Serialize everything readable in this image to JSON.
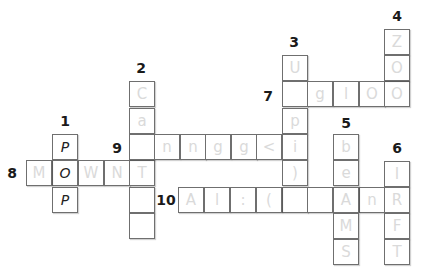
{
  "puzzle": {
    "cell_size": 26,
    "numbers": [
      {
        "label": "1",
        "x": 65,
        "y": 121
      },
      {
        "label": "2",
        "x": 141,
        "y": 68
      },
      {
        "label": "3",
        "x": 294,
        "y": 42
      },
      {
        "label": "4",
        "x": 397,
        "y": 16
      },
      {
        "label": "5",
        "x": 346,
        "y": 123
      },
      {
        "label": "6",
        "x": 397,
        "y": 148
      },
      {
        "label": "7",
        "x": 268,
        "y": 96
      },
      {
        "label": "8",
        "x": 12,
        "y": 173
      },
      {
        "label": "9",
        "x": 117,
        "y": 148
      },
      {
        "label": "10",
        "x": 166,
        "y": 200
      }
    ],
    "cells": [
      {
        "x": 52,
        "y": 134,
        "printed": "P"
      },
      {
        "x": 52,
        "y": 160,
        "printed": "O"
      },
      {
        "x": 52,
        "y": 187,
        "printed": "P"
      },
      {
        "x": 26,
        "y": 160,
        "pencil": "M"
      },
      {
        "x": 78,
        "y": 160,
        "pencil": "W"
      },
      {
        "x": 104,
        "y": 160,
        "pencil": "N"
      },
      {
        "x": 129,
        "y": 160,
        "pencil": "T"
      },
      {
        "x": 129,
        "y": 81,
        "pencil": "C"
      },
      {
        "x": 129,
        "y": 108,
        "pencil": "a"
      },
      {
        "x": 129,
        "y": 134,
        "pencil": ""
      },
      {
        "x": 129,
        "y": 187,
        "pencil": ""
      },
      {
        "x": 129,
        "y": 213,
        "pencil": ""
      },
      {
        "x": 154,
        "y": 134,
        "pencil": "n"
      },
      {
        "x": 180,
        "y": 134,
        "pencil": "n"
      },
      {
        "x": 205,
        "y": 134,
        "pencil": "g"
      },
      {
        "x": 231,
        "y": 134,
        "pencil": "g"
      },
      {
        "x": 256,
        "y": 134,
        "pencil": "<"
      },
      {
        "x": 282,
        "y": 55,
        "pencil": "U"
      },
      {
        "x": 282,
        "y": 81,
        "pencil": ""
      },
      {
        "x": 282,
        "y": 108,
        "pencil": "p"
      },
      {
        "x": 282,
        "y": 134,
        "pencil": "i"
      },
      {
        "x": 282,
        "y": 160,
        "pencil": ")"
      },
      {
        "x": 282,
        "y": 187,
        "pencil": ""
      },
      {
        "x": 307,
        "y": 81,
        "pencil": "g"
      },
      {
        "x": 333,
        "y": 81,
        "pencil": "l"
      },
      {
        "x": 359,
        "y": 81,
        "pencil": "O"
      },
      {
        "x": 384,
        "y": 81,
        "pencil": "O"
      },
      {
        "x": 384,
        "y": 29,
        "pencil": "Z"
      },
      {
        "x": 384,
        "y": 55,
        "pencil": "O"
      },
      {
        "x": 178,
        "y": 187,
        "pencil": "A"
      },
      {
        "x": 204,
        "y": 187,
        "pencil": "l"
      },
      {
        "x": 230,
        "y": 187,
        "pencil": ":"
      },
      {
        "x": 256,
        "y": 187,
        "pencil": "("
      },
      {
        "x": 307,
        "y": 187,
        "pencil": ""
      },
      {
        "x": 359,
        "y": 187,
        "pencil": "n"
      },
      {
        "x": 333,
        "y": 134,
        "pencil": "b"
      },
      {
        "x": 333,
        "y": 160,
        "pencil": "e"
      },
      {
        "x": 333,
        "y": 187,
        "pencil": "A"
      },
      {
        "x": 333,
        "y": 213,
        "pencil": "M"
      },
      {
        "x": 333,
        "y": 239,
        "pencil": "S"
      },
      {
        "x": 384,
        "y": 161,
        "pencil": "I"
      },
      {
        "x": 384,
        "y": 187,
        "pencil": "R"
      },
      {
        "x": 384,
        "y": 213,
        "pencil": "F"
      },
      {
        "x": 384,
        "y": 239,
        "pencil": "T"
      }
    ]
  }
}
